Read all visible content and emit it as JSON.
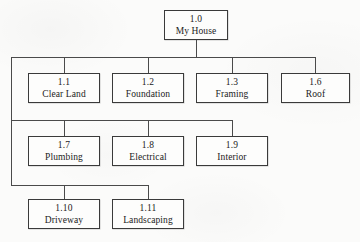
{
  "diagram": {
    "type": "work-breakdown-structure",
    "colors": {
      "background": "#fbfbfa",
      "box_fill": "#fdfdfc",
      "box_border": "#3a3a3a",
      "connector": "#4a4a4a",
      "text": "#1b1b1b"
    },
    "root": {
      "code": "1.0",
      "label": "My House"
    },
    "rows": [
      {
        "row_index": 1,
        "nodes": [
          {
            "code": "1.1",
            "label": "Clear Land"
          },
          {
            "code": "1.2",
            "label": "Foundation"
          },
          {
            "code": "1.3",
            "label": "Framing"
          },
          {
            "code": "1.6",
            "label": "Roof"
          }
        ]
      },
      {
        "row_index": 2,
        "nodes": [
          {
            "code": "1.7",
            "label": "Plumbing"
          },
          {
            "code": "1.8",
            "label": "Electrical"
          },
          {
            "code": "1.9",
            "label": "Interior"
          }
        ]
      },
      {
        "row_index": 3,
        "nodes": [
          {
            "code": "1.10",
            "label": "Driveway"
          },
          {
            "code": "1.11",
            "label": "Landscaping"
          }
        ]
      }
    ]
  }
}
